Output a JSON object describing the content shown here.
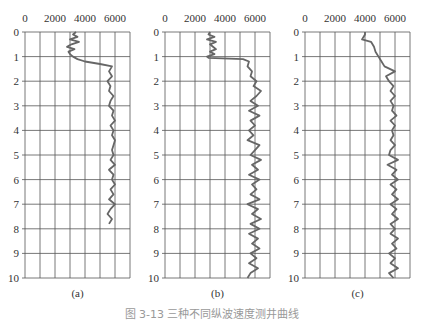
{
  "figure": {
    "caption": "图 3-13 三种不同纵波速度测井曲线"
  },
  "colors": {
    "grid": "#555555",
    "curve": "#666666",
    "text": "#333333",
    "background": "#ffffff"
  },
  "chart_data": [
    {
      "type": "line",
      "panel_label": "(a)",
      "title": "",
      "xlabel": "",
      "ylabel": "",
      "x_tick_labels": [
        "0",
        "2000",
        "4000",
        "6000"
      ],
      "x_ticks": [
        0,
        2000,
        4000,
        6000
      ],
      "y_tick_labels": [
        "0",
        "1",
        "2",
        "3",
        "4",
        "5",
        "6",
        "7",
        "8",
        "9",
        "10"
      ],
      "xlim": [
        0,
        7000
      ],
      "ylim": [
        10,
        0
      ],
      "grid": true,
      "orientation": "depth-down",
      "series": [
        {
          "name": "curve-a",
          "depth": [
            0,
            0.1,
            0.2,
            0.3,
            0.4,
            0.5,
            0.6,
            0.7,
            0.8,
            0.9,
            1.0,
            1.1,
            1.2,
            1.3,
            1.4,
            1.5,
            1.6,
            1.8,
            2.0,
            2.2,
            2.4,
            2.6,
            2.8,
            3.0,
            3.2,
            3.4,
            3.6,
            3.8,
            4.0,
            4.2,
            4.4,
            4.6,
            4.8,
            5.0,
            5.2,
            5.4,
            5.6,
            5.8,
            6.0,
            6.2,
            6.4,
            6.6,
            6.8,
            7.0,
            7.2,
            7.4,
            7.6,
            7.8
          ],
          "values": [
            3400,
            3200,
            3500,
            3000,
            3600,
            3100,
            2800,
            3300,
            2900,
            3000,
            3200,
            3500,
            4000,
            5000,
            5800,
            5700,
            5600,
            5800,
            5500,
            5700,
            5600,
            5900,
            5700,
            5600,
            5900,
            5800,
            6000,
            5700,
            5900,
            5800,
            6000,
            5900,
            5800,
            5900,
            5700,
            6000,
            5600,
            5900,
            5800,
            6000,
            5700,
            5900,
            5600,
            6000,
            5700,
            5500,
            5800,
            5600
          ]
        }
      ]
    },
    {
      "type": "line",
      "panel_label": "(b)",
      "title": "",
      "xlabel": "",
      "ylabel": "",
      "x_tick_labels": [
        "0",
        "2000",
        "4000",
        "6000"
      ],
      "x_ticks": [
        0,
        2000,
        4000,
        6000
      ],
      "y_tick_labels": [
        "0",
        "1",
        "2",
        "3",
        "4",
        "5",
        "6",
        "7",
        "8",
        "9",
        "10"
      ],
      "xlim": [
        0,
        7000
      ],
      "ylim": [
        10,
        0
      ],
      "grid": true,
      "orientation": "depth-down",
      "series": [
        {
          "name": "curve-b",
          "depth": [
            0,
            0.1,
            0.2,
            0.3,
            0.4,
            0.5,
            0.6,
            0.7,
            0.8,
            0.9,
            1.0,
            1.05,
            1.1,
            1.2,
            1.4,
            1.6,
            1.8,
            2.0,
            2.2,
            2.4,
            2.6,
            2.8,
            3.0,
            3.2,
            3.4,
            3.6,
            3.8,
            4.0,
            4.2,
            4.4,
            4.6,
            4.8,
            5.0,
            5.2,
            5.4,
            5.6,
            5.8,
            6.0,
            6.2,
            6.4,
            6.6,
            6.8,
            7.0,
            7.2,
            7.4,
            7.6,
            7.8,
            8.0,
            8.2,
            8.4,
            8.6,
            8.8,
            9.0,
            9.2,
            9.4,
            9.6,
            9.8,
            10.0
          ],
          "values": [
            3000,
            2900,
            3300,
            2800,
            3400,
            3000,
            3200,
            3400,
            3000,
            3300,
            2800,
            2900,
            5200,
            5600,
            5500,
            5800,
            5700,
            6100,
            5900,
            6400,
            6100,
            5700,
            6200,
            5600,
            6300,
            5700,
            6000,
            5600,
            5900,
            5500,
            6300,
            6000,
            5700,
            6400,
            5800,
            6200,
            5600,
            6300,
            5800,
            6100,
            5700,
            6300,
            5500,
            6200,
            5800,
            6400,
            5700,
            6300,
            5600,
            6200,
            5800,
            6300,
            5700,
            6100,
            5600,
            6200,
            5700,
            5500
          ]
        }
      ]
    },
    {
      "type": "line",
      "panel_label": "(c)",
      "title": "",
      "xlabel": "",
      "ylabel": "",
      "x_tick_labels": [
        "0",
        "2000",
        "4000",
        "6000"
      ],
      "x_ticks": [
        0,
        2000,
        4000,
        6000
      ],
      "y_tick_labels": [
        "0",
        "1",
        "2",
        "3",
        "4",
        "5",
        "6",
        "7",
        "8",
        "9",
        "10"
      ],
      "xlim": [
        0,
        7000
      ],
      "ylim": [
        10,
        0
      ],
      "grid": true,
      "orientation": "depth-down",
      "series": [
        {
          "name": "curve-c",
          "depth": [
            0,
            0.1,
            0.2,
            0.3,
            0.4,
            0.5,
            0.6,
            0.8,
            1.0,
            1.2,
            1.4,
            1.6,
            1.8,
            2.0,
            2.2,
            2.4,
            2.6,
            2.8,
            3.0,
            3.2,
            3.4,
            3.6,
            3.8,
            4.0,
            4.2,
            4.4,
            4.6,
            4.8,
            5.0,
            5.2,
            5.4,
            5.6,
            5.8,
            6.0,
            6.2,
            6.4,
            6.6,
            6.8,
            7.0,
            7.2,
            7.4,
            7.6,
            7.8,
            8.0,
            8.2,
            8.4,
            8.6,
            8.8,
            9.0,
            9.2,
            9.4,
            9.6,
            9.8,
            10.0
          ],
          "values": [
            4000,
            4000,
            3900,
            3800,
            4400,
            4500,
            4600,
            4700,
            4900,
            5100,
            5300,
            6000,
            5400,
            5600,
            5900,
            5700,
            6000,
            5700,
            5900,
            5800,
            6100,
            5700,
            6000,
            5800,
            5900,
            5700,
            6000,
            5700,
            5600,
            6200,
            5500,
            6100,
            5800,
            6200,
            5700,
            6100,
            5800,
            6200,
            5700,
            6100,
            5800,
            6200,
            5700,
            6000,
            5700,
            6200,
            5800,
            6100,
            5600,
            6000,
            5700,
            6200,
            5600,
            5900
          ]
        }
      ]
    }
  ]
}
